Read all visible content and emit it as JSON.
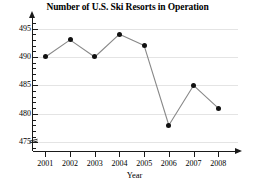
{
  "chart_data": {
    "type": "line",
    "title": "Number of U.S. Ski Resorts in Operation",
    "xlabel": "Year",
    "ylabel": "",
    "categories": [
      "2001",
      "2002",
      "2003",
      "2004",
      "2005",
      "2006",
      "2007",
      "2008"
    ],
    "values": [
      490,
      493,
      490,
      494,
      492,
      478,
      485,
      481
    ],
    "x": [
      2001,
      2002,
      2003,
      2004,
      2005,
      2006,
      2007,
      2008
    ],
    "ylim": [
      474,
      496.5
    ],
    "xlim": [
      2000.5,
      2008.8
    ],
    "yticks": [
      475,
      480,
      485,
      490,
      495
    ],
    "ytick_labels": [
      "475",
      "480",
      "485",
      "490",
      "495"
    ],
    "yminor_step": 1,
    "grid": true,
    "grid_axis": "y",
    "legend": false,
    "axis_break": true,
    "axis_break_note": "y-axis broken below 475",
    "marker": "filled-circle",
    "marker_color": "#111111",
    "line_color": "#888888",
    "grid_color": "#e4e4e4",
    "axis_color": "#1a1a1a",
    "background": "#ffffff"
  }
}
